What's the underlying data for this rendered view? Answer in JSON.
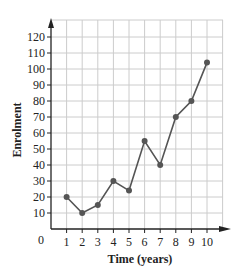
{
  "chart_data": {
    "type": "line",
    "title": "",
    "xlabel": "Time (years)",
    "ylabel": "Enrolment",
    "x": [
      1,
      2,
      3,
      4,
      5,
      6,
      7,
      8,
      9,
      10
    ],
    "series": [
      {
        "name": "Enrolment",
        "values": [
          20,
          10,
          15,
          30,
          24,
          55,
          40,
          70,
          80,
          104
        ]
      }
    ],
    "xticks": [
      1,
      2,
      3,
      4,
      5,
      6,
      7,
      8,
      9,
      10
    ],
    "yticks": [
      10,
      20,
      30,
      40,
      50,
      60,
      70,
      80,
      90,
      100,
      110,
      120
    ],
    "origin_label": "0",
    "xlim": [
      0,
      11.5
    ],
    "ylim": [
      0,
      125
    ],
    "grid": true,
    "legend": null,
    "colors": {
      "line": "#555555",
      "marker": "#555555",
      "grid": "#cccccc",
      "axis": "#222222"
    }
  }
}
